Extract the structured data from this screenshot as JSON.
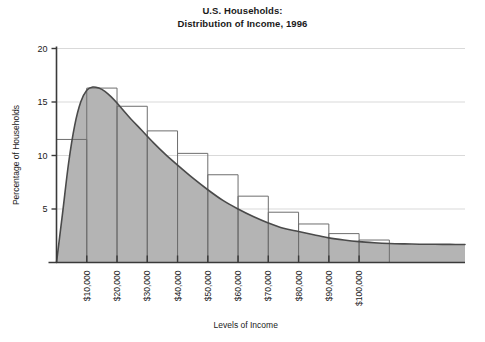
{
  "chart_data": {
    "type": "area",
    "title": "U.S. Households:\nDistribution of Income, 1996",
    "title_lines": [
      "U.S. Households:",
      "Distribution of Income, 1996"
    ],
    "xlabel": "Levels of Income",
    "ylabel": "Percentage of Households",
    "xlim": [
      0,
      135000
    ],
    "ylim": [
      0,
      20
    ],
    "grid": true,
    "legend": null,
    "yticks": [
      5,
      10,
      15,
      20
    ],
    "ytick_labels": [
      "5",
      "10",
      "15",
      "20"
    ],
    "xticks": [
      10000,
      20000,
      30000,
      40000,
      50000,
      60000,
      70000,
      80000,
      90000,
      100000
    ],
    "xtick_labels": [
      "$10,000",
      "$20,000",
      "$30,000",
      "$40,000",
      "$50,000",
      "$60,000",
      "$70,000",
      "$80,000",
      "$90,000",
      "$100,000"
    ],
    "xtick_label_rotation": -90,
    "bins": [
      {
        "label": "$0-$10,000",
        "x0": 0,
        "x1": 10000,
        "value": 11.5
      },
      {
        "label": "$10,000-$20,000",
        "x0": 10000,
        "x1": 20000,
        "value": 16.3
      },
      {
        "label": "$20,000-$30,000",
        "x0": 20000,
        "x1": 30000,
        "value": 14.6
      },
      {
        "label": "$30,000-$40,000",
        "x0": 30000,
        "x1": 40000,
        "value": 12.3
      },
      {
        "label": "$40,000-$50,000",
        "x0": 40000,
        "x1": 50000,
        "value": 10.2
      },
      {
        "label": "$50,000-$60,000",
        "x0": 50000,
        "x1": 60000,
        "value": 8.2
      },
      {
        "label": "$60,000-$70,000",
        "x0": 60000,
        "x1": 70000,
        "value": 6.2
      },
      {
        "label": "$70,000-$80,000",
        "x0": 70000,
        "x1": 80000,
        "value": 4.7
      },
      {
        "label": "$80,000-$90,000",
        "x0": 80000,
        "x1": 90000,
        "value": 3.6
      },
      {
        "label": "$90,000-$100,000",
        "x0": 90000,
        "x1": 100000,
        "value": 2.7
      },
      {
        "label": "$100,000+",
        "x0": 100000,
        "x1": 110000,
        "value": 2.1
      }
    ],
    "curve": {
      "name": "Smoothed income distribution",
      "x": [
        0,
        2000,
        4000,
        6000,
        8000,
        10000,
        12000,
        14000,
        16000,
        18000,
        20000,
        24000,
        28000,
        32000,
        36000,
        40000,
        45000,
        50000,
        55000,
        60000,
        65000,
        70000,
        75000,
        80000,
        85000,
        90000,
        95000,
        100000,
        105000,
        110000,
        115000,
        120000,
        125000,
        130000,
        135000
      ],
      "y": [
        0.0,
        4.6,
        9.3,
        12.8,
        15.0,
        16.1,
        16.4,
        16.3,
        16.0,
        15.5,
        14.9,
        13.6,
        12.4,
        11.2,
        10.1,
        9.1,
        7.9,
        6.8,
        5.8,
        5.0,
        4.3,
        3.7,
        3.2,
        2.9,
        2.6,
        2.3,
        2.1,
        1.95,
        1.85,
        1.78,
        1.74,
        1.71,
        1.7,
        1.69,
        1.68
      ]
    },
    "colors": {
      "fill": "#b4b4b4",
      "curve_line": "#4a4a4a",
      "bar_outline": "#6e6e6e",
      "axis": "#3a3a3a",
      "grid": "#d9d9d9",
      "text": "#1a1a1a",
      "background": "#ffffff"
    }
  }
}
